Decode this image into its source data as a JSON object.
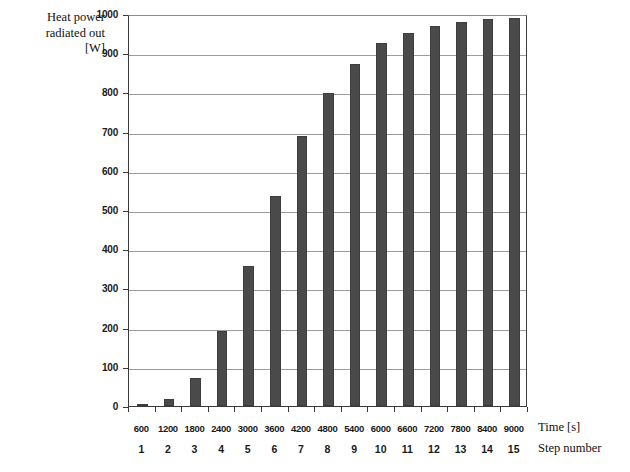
{
  "chart_data": {
    "type": "bar",
    "title": "",
    "ylabel": "Heat power radiated out [W]",
    "ylabel_lines": [
      "Heat power",
      "radiated out",
      "[W]"
    ],
    "xlabel": "Time [s]",
    "xlabel_secondary": "Step number",
    "ylim": [
      0,
      1000
    ],
    "ytick_step": 100,
    "yticks": [
      0,
      100,
      200,
      300,
      400,
      500,
      600,
      700,
      800,
      900,
      1000
    ],
    "ytick_labels": [
      "0",
      "100",
      "200",
      "300",
      "400",
      "500",
      "600",
      "700",
      "800",
      "900",
      "1000"
    ],
    "grid": true,
    "grid_axis": "y",
    "legend": false,
    "categories": [
      "600",
      "1200",
      "1800",
      "2400",
      "3000",
      "3600",
      "4200",
      "4800",
      "5400",
      "6000",
      "6600",
      "7200",
      "7800",
      "8400",
      "9000"
    ],
    "step_numbers": [
      "1",
      "2",
      "3",
      "4",
      "5",
      "6",
      "7",
      "8",
      "9",
      "10",
      "11",
      "12",
      "13",
      "14",
      "15"
    ],
    "values": [
      5,
      17,
      72,
      192,
      358,
      535,
      688,
      798,
      873,
      925,
      952,
      970,
      980,
      987,
      991
    ],
    "bar_color": "#4a4a4a",
    "background_color": "#ffffff",
    "gridline_color": "#9b9b9b",
    "axis_color": "#3a3a3a"
  }
}
